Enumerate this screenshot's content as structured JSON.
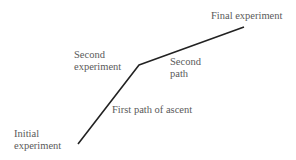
{
  "diagram": {
    "path_points": [
      [
        78,
        144
      ],
      [
        139,
        65
      ],
      [
        244,
        27
      ]
    ],
    "line_color": "#222222",
    "labels": {
      "initial_line1": "Initial",
      "initial_line2": "experiment",
      "second_exp_line1": "Second",
      "second_exp_line2": "experiment",
      "second_path_line1": "Second",
      "second_path_line2": "path",
      "first_path": "First path of ascent",
      "final": "Final experiment"
    }
  }
}
